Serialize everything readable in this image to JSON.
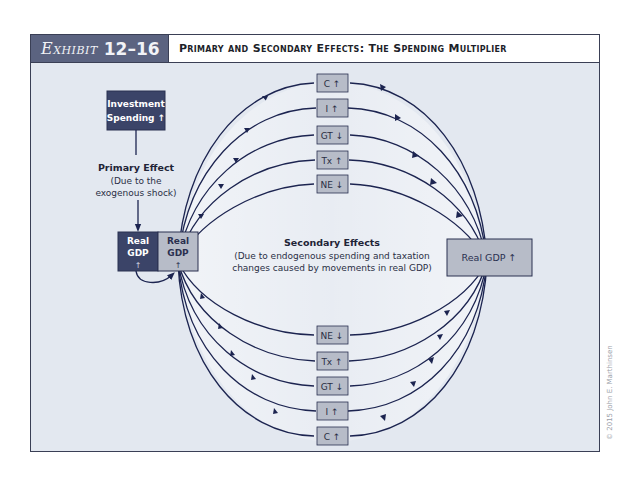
{
  "header": {
    "exhibit_word": "Exhibit",
    "exhibit_number": "12–16",
    "title": "Primary and Secondary Effects: The Spending Multiplier"
  },
  "diagram": {
    "investment_box": {
      "line1": "Investment",
      "line2": "Spending ↑"
    },
    "primary_effect": {
      "title": "Primary Effect",
      "line1": "(Due to the",
      "line2": "exogenous shock)"
    },
    "real_gdp_left_dark": {
      "line1": "Real",
      "line2": "GDP",
      "arrow": "↑"
    },
    "real_gdp_left_light": {
      "line1": "Real",
      "line2": "GDP",
      "arrow": "↑"
    },
    "real_gdp_right": {
      "label": "Real GDP ↑"
    },
    "secondary_effects": {
      "title": "Secondary Effects",
      "line1": "(Due to endogenous spending and taxation",
      "line2": "changes caused by movements in real GDP)"
    },
    "top_boxes": [
      {
        "label": "C ↑"
      },
      {
        "label": "I ↑"
      },
      {
        "label": "GT ↓"
      },
      {
        "label": "Tx ↑"
      },
      {
        "label": "NE ↓"
      }
    ],
    "bottom_boxes": [
      {
        "label": "NE ↓"
      },
      {
        "label": "Tx ↑"
      },
      {
        "label": "GT ↓"
      },
      {
        "label": "I ↑"
      },
      {
        "label": "C ↑"
      }
    ]
  },
  "colors": {
    "dark_navy": "#3b4468",
    "box_gray": "#b7bcc8",
    "line": "#1c2450",
    "panel_bg": "#e3e8f0"
  },
  "copyright": "© 2015 John E. Marthinsen"
}
